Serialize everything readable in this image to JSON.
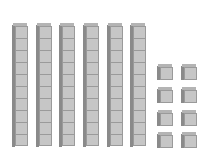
{
  "diagram": {
    "title": "",
    "tens_rods": {
      "count": 6,
      "cubes_per_rod": 10,
      "x_positions": [
        12,
        36,
        59,
        83,
        107,
        130
      ]
    },
    "unit_cubes": {
      "count": 8,
      "positions": [
        {
          "x": 157,
          "y": 64
        },
        {
          "x": 181,
          "y": 64
        },
        {
          "x": 157,
          "y": 87
        },
        {
          "x": 181,
          "y": 87
        },
        {
          "x": 157,
          "y": 110
        },
        {
          "x": 181,
          "y": 110
        },
        {
          "x": 157,
          "y": 132
        },
        {
          "x": 181,
          "y": 132
        }
      ]
    },
    "value_represented": 68,
    "colors": {
      "face": "#c6c6c6",
      "side": "#8a8a8a",
      "top": "#b4b4b4",
      "edge": "#9a9a9a"
    }
  }
}
